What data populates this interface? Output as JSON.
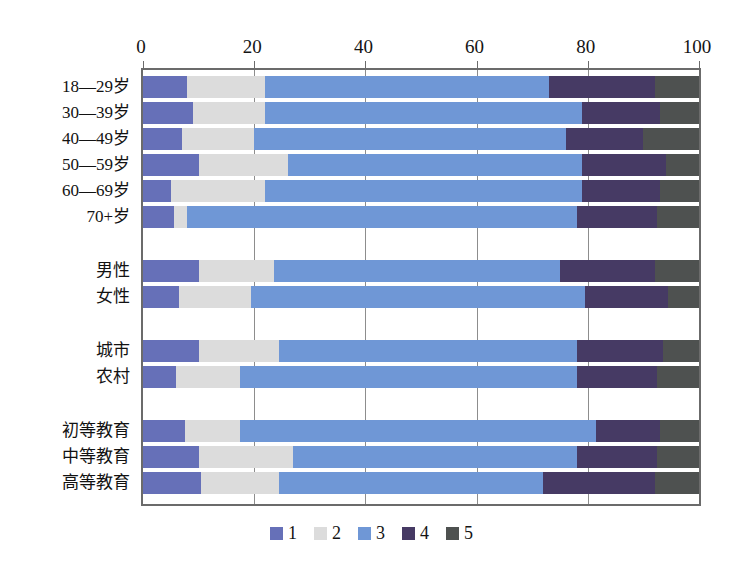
{
  "chart_data": {
    "type": "bar",
    "orientation": "horizontal",
    "stacked": true,
    "stack_total": 100,
    "title": "",
    "xlabel": "",
    "ylabel": "",
    "xlim": [
      0,
      100
    ],
    "xticks": [
      0,
      20,
      40,
      60,
      80,
      100
    ],
    "xtick_labels": [
      "0",
      "20",
      "40",
      "60",
      "80",
      "100"
    ],
    "grid": "vertical",
    "axis_position": "top",
    "legend": {
      "position": "bottom-center",
      "entries": [
        {
          "label": "1",
          "color": "#6670b8"
        },
        {
          "label": "2",
          "color": "#dcdcdc"
        },
        {
          "label": "3",
          "color": "#6f97d6"
        },
        {
          "label": "4",
          "color": "#463a64"
        },
        {
          "label": "5",
          "color": "#4e5150"
        }
      ]
    },
    "series": [
      {
        "name": "1",
        "color": "#6670b8"
      },
      {
        "name": "2",
        "color": "#dcdcdc"
      },
      {
        "name": "3",
        "color": "#6f97d6"
      },
      {
        "name": "4",
        "color": "#463a64"
      },
      {
        "name": "5",
        "color": "#4e5150"
      }
    ],
    "groups": [
      {
        "name": "age",
        "categories": [
          "18—29岁",
          "30—39岁",
          "40—49岁",
          "50—59岁",
          "60—69岁",
          "70+岁"
        ],
        "values": [
          [
            8,
            14,
            51,
            19,
            8
          ],
          [
            9,
            13,
            57,
            14,
            7
          ],
          [
            7,
            13,
            56,
            14,
            10
          ],
          [
            10,
            16,
            53,
            15,
            6
          ],
          [
            5,
            17,
            57,
            14,
            7
          ],
          [
            5.5,
            2.5,
            70,
            14.5,
            7.5
          ]
        ]
      },
      {
        "name": "gender",
        "categories": [
          "男性",
          "女性"
        ],
        "values": [
          [
            10,
            13.5,
            51.5,
            17,
            8
          ],
          [
            6.5,
            13,
            60,
            15,
            5.5
          ]
        ]
      },
      {
        "name": "residence",
        "categories": [
          "城市",
          "农村"
        ],
        "values": [
          [
            10,
            14.5,
            53.5,
            15.5,
            6.5
          ],
          [
            6,
            11.5,
            60.5,
            14.5,
            7.5
          ]
        ]
      },
      {
        "name": "education",
        "categories": [
          "初等教育",
          "中等教育",
          "高等教育"
        ],
        "values": [
          [
            7.5,
            10,
            64,
            11.5,
            7
          ],
          [
            10,
            17,
            51,
            14.5,
            7.5
          ],
          [
            10.5,
            14,
            47.5,
            20,
            8
          ]
        ]
      }
    ]
  },
  "colors": {
    "axis": "#6b6b6b",
    "gridline": "#8d8d8d",
    "background": "#ffffff",
    "text": "#141414"
  }
}
